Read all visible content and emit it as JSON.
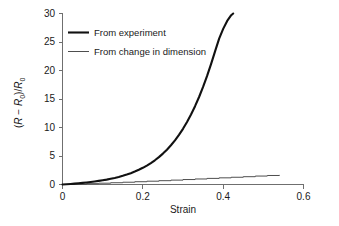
{
  "chart_data": {
    "type": "line",
    "title": "",
    "xlabel": "Strain",
    "ylabel": "(R − R0)/R0",
    "ylabel_parts": {
      "open_paren": "(",
      "r1": "R",
      "minus": " − ",
      "r2": "R",
      "sub1": "0",
      "close_slash": ")/",
      "r3": "R",
      "sub2": "0"
    },
    "xlim": [
      0,
      0.6
    ],
    "ylim": [
      0,
      30
    ],
    "xticks": [
      "0",
      "0.2",
      "0.4",
      "0.6"
    ],
    "xtick_values": [
      0,
      0.2,
      0.4,
      0.6
    ],
    "yticks": [
      "0",
      "5",
      "10",
      "15",
      "20",
      "25",
      "30"
    ],
    "ytick_values": [
      0,
      5,
      10,
      15,
      20,
      25,
      30
    ],
    "grid": false,
    "legend_position": "top-left-inside",
    "series": [
      {
        "name": "From experiment",
        "style": "thick-solid",
        "color": "#111111",
        "x": [
          0.0,
          0.01,
          0.02,
          0.03,
          0.04,
          0.05,
          0.06,
          0.07,
          0.08,
          0.09,
          0.1,
          0.11,
          0.12,
          0.13,
          0.14,
          0.15,
          0.16,
          0.17,
          0.18,
          0.19,
          0.2,
          0.21,
          0.22,
          0.23,
          0.24,
          0.25,
          0.26,
          0.27,
          0.28,
          0.29,
          0.3,
          0.31,
          0.32,
          0.33,
          0.34,
          0.35,
          0.36,
          0.37,
          0.38,
          0.39,
          0.4,
          0.41,
          0.42,
          0.425
        ],
        "y": [
          0.0,
          0.05,
          0.1,
          0.16,
          0.22,
          0.29,
          0.36,
          0.44,
          0.53,
          0.63,
          0.74,
          0.86,
          1.0,
          1.15,
          1.32,
          1.52,
          1.74,
          1.99,
          2.27,
          2.58,
          2.93,
          3.32,
          3.76,
          4.25,
          4.8,
          5.42,
          6.11,
          6.88,
          7.74,
          8.7,
          9.77,
          10.96,
          12.28,
          13.74,
          15.35,
          17.12,
          19.05,
          21.15,
          23.4,
          25.6,
          27.3,
          28.7,
          29.7,
          30.0
        ]
      },
      {
        "name": "From change in dimension",
        "style": "thin-solid-stepped",
        "color": "#3a3a3a",
        "x": [
          0.0,
          0.03,
          0.06,
          0.09,
          0.12,
          0.15,
          0.18,
          0.21,
          0.24,
          0.27,
          0.3,
          0.33,
          0.36,
          0.39,
          0.42,
          0.45,
          0.48,
          0.51,
          0.54
        ],
        "y": [
          0.0,
          0.07,
          0.15,
          0.23,
          0.31,
          0.4,
          0.49,
          0.58,
          0.67,
          0.77,
          0.87,
          0.97,
          1.07,
          1.17,
          1.27,
          1.37,
          1.48,
          1.58,
          1.68
        ]
      }
    ],
    "legend_entries": [
      {
        "label": "From experiment",
        "style": "thick"
      },
      {
        "label": "From change in dimension",
        "style": "thin"
      }
    ]
  },
  "colors": {
    "background": "#ffffff",
    "axis": "#6f6f6f",
    "text": "#1a1a1a",
    "series_thick": "#111111",
    "series_thin": "#3a3a3a"
  }
}
